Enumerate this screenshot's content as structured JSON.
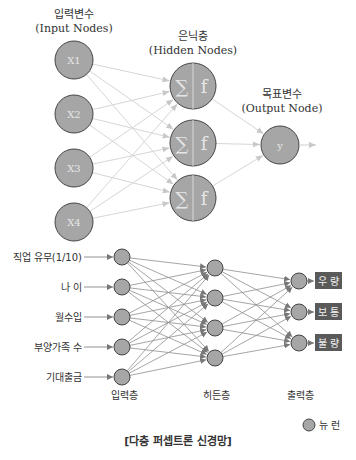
{
  "top_diagram": {
    "input_title_ko": "입력변수",
    "input_title_en": "(Input Nodes)",
    "hidden_title_ko": "은닉층",
    "hidden_title_en": "(Hidden Nodes)",
    "output_title_ko": "목표변수",
    "output_title_en": "(Output Node)",
    "inputs": [
      {
        "label": "X1"
      },
      {
        "label": "X2"
      },
      {
        "label": "X3"
      },
      {
        "label": "X4"
      }
    ],
    "hidden": [
      {
        "sum": "∑",
        "fn": "f"
      },
      {
        "sum": "∑",
        "fn": "f"
      },
      {
        "sum": "∑",
        "fn": "f"
      }
    ],
    "output": {
      "label": "y"
    }
  },
  "bottom_diagram": {
    "inputs": [
      {
        "label": "직업 유무(1/10)"
      },
      {
        "label": "나 이"
      },
      {
        "label": "월수입"
      },
      {
        "label": "부양가족 수"
      },
      {
        "label": "기대출금"
      }
    ],
    "outputs": [
      {
        "label": "우 량"
      },
      {
        "label": "보 통"
      },
      {
        "label": "불 량"
      }
    ],
    "layer_labels": {
      "input": "입력층",
      "hidden": "히든층",
      "output": "출력층"
    },
    "legend": {
      "label": "뉴 런"
    },
    "caption": "[다층 퍼셉트론 신경망]"
  },
  "colors": {
    "node_fill": "#a6a6a6",
    "node_stroke": "#444444",
    "edge_light": "#d4d4d4",
    "edge_dark": "#8a8a8a",
    "label_box": "#5a5a5a"
  }
}
